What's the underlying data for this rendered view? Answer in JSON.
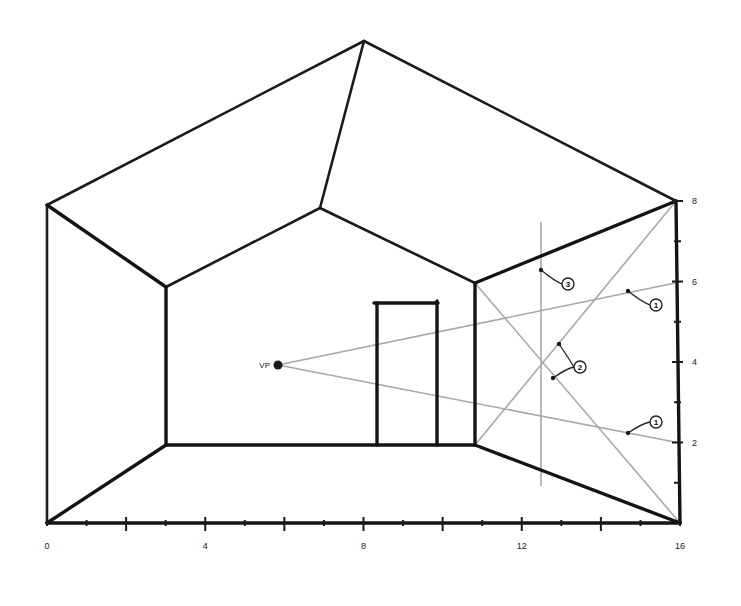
{
  "diagram": {
    "title": "",
    "type": "one-point-perspective-room",
    "vanishing_point": {
      "label": "VP",
      "x": 278,
      "y": 365
    },
    "outer_frame": {
      "bottom_left": [
        47,
        523
      ],
      "bottom_right": [
        680,
        523
      ],
      "top_left": [
        47,
        205
      ],
      "top_right": [
        676,
        201
      ],
      "apex": [
        364,
        41
      ]
    },
    "back_wall": {
      "top_left": [
        166,
        287
      ],
      "top_right": [
        475,
        283
      ],
      "bottom_left": [
        166,
        445
      ],
      "bottom_right": [
        475,
        445
      ],
      "apex": [
        320,
        208
      ]
    },
    "door": {
      "left": 377,
      "right": 437,
      "top": 303,
      "bottom": 445
    },
    "guide_lines": [
      {
        "name": "vp-to-6",
        "from": [
          278,
          365
        ],
        "to": [
          680,
          282
        ]
      },
      {
        "name": "vp-to-2",
        "from": [
          278,
          365
        ],
        "to": [
          680,
          443
        ]
      },
      {
        "name": "diag-floor-to-top",
        "from": [
          475,
          445
        ],
        "to": [
          676,
          201
        ]
      },
      {
        "name": "diag-top-to-floor",
        "from": [
          475,
          283
        ],
        "to": [
          680,
          523
        ]
      },
      {
        "name": "vertical-measure",
        "from": [
          541,
          222
        ],
        "to": [
          541,
          486
        ]
      }
    ],
    "callouts": [
      {
        "label": "3",
        "badge": [
          568,
          284
        ],
        "targets": [
          [
            541,
            270
          ]
        ]
      },
      {
        "label": "1",
        "badge": [
          656,
          305
        ],
        "targets": [
          [
            628,
            291
          ]
        ]
      },
      {
        "label": "2",
        "badge": [
          580,
          367
        ],
        "targets": [
          [
            559,
            344
          ],
          [
            553,
            378
          ]
        ]
      },
      {
        "label": "1",
        "badge": [
          656,
          422
        ],
        "targets": [
          [
            628,
            433
          ]
        ]
      }
    ]
  },
  "x_axis": {
    "y": 523,
    "x0": 47,
    "x16": 680,
    "min": 0,
    "max": 16,
    "tick_step": 1,
    "labels": [
      "0",
      "4",
      "8",
      "12",
      "16"
    ],
    "label_values": [
      0,
      4,
      8,
      12,
      16
    ]
  },
  "y_axis": {
    "x": 680,
    "y0": 523,
    "y8": 201,
    "min": 0,
    "max": 8,
    "tick_step": 1,
    "labels": [
      "2",
      "4",
      "6",
      "8"
    ],
    "label_values": [
      2,
      4,
      6,
      8
    ]
  }
}
